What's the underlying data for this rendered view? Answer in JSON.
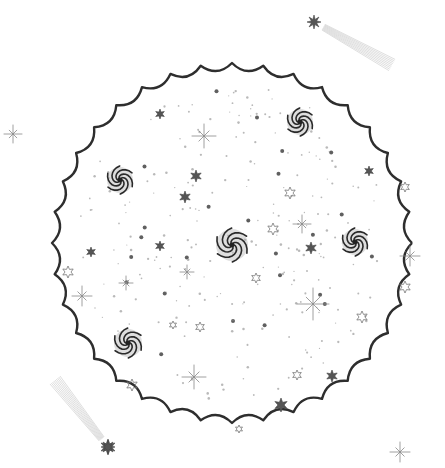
{
  "illustration": {
    "subject": "pencil drawing of a scalloped circular space scene with spiral galaxies, stars and shooting stars",
    "background": "#ffffff",
    "stroke_color": "#2e2e2e",
    "scallop_circle": {
      "cx": 232,
      "cy": 243,
      "r": 180,
      "bumps": 36
    },
    "galaxies": [
      {
        "x": 120,
        "y": 180,
        "r": 13
      },
      {
        "x": 300,
        "y": 122,
        "r": 13
      },
      {
        "x": 232,
        "y": 245,
        "r": 16
      },
      {
        "x": 355,
        "y": 242,
        "r": 13
      },
      {
        "x": 128,
        "y": 343,
        "r": 14
      }
    ],
    "filled_stars": [
      {
        "x": 196,
        "y": 176,
        "s": 6
      },
      {
        "x": 185,
        "y": 197,
        "s": 6
      },
      {
        "x": 91,
        "y": 252,
        "s": 5
      },
      {
        "x": 160,
        "y": 246,
        "s": 5
      },
      {
        "x": 311,
        "y": 248,
        "s": 6
      },
      {
        "x": 369,
        "y": 171,
        "s": 5
      },
      {
        "x": 160,
        "y": 114,
        "s": 5
      },
      {
        "x": 332,
        "y": 376,
        "s": 6
      },
      {
        "x": 281,
        "y": 405,
        "s": 7
      },
      {
        "x": 108,
        "y": 447,
        "s": 8
      }
    ],
    "outline_stars": [
      {
        "x": 290,
        "y": 193,
        "s": 6
      },
      {
        "x": 273,
        "y": 229,
        "s": 6
      },
      {
        "x": 68,
        "y": 272,
        "s": 6
      },
      {
        "x": 256,
        "y": 278,
        "s": 5
      },
      {
        "x": 200,
        "y": 327,
        "s": 5
      },
      {
        "x": 173,
        "y": 325,
        "s": 4
      },
      {
        "x": 132,
        "y": 385,
        "s": 6
      },
      {
        "x": 297,
        "y": 375,
        "s": 5
      },
      {
        "x": 362,
        "y": 317,
        "s": 6
      },
      {
        "x": 405,
        "y": 287,
        "s": 6
      },
      {
        "x": 405,
        "y": 187,
        "s": 5
      },
      {
        "x": 239,
        "y": 429,
        "s": 4
      }
    ],
    "sparkles": [
      {
        "x": 204,
        "y": 136,
        "s": 12
      },
      {
        "x": 302,
        "y": 224,
        "s": 9
      },
      {
        "x": 82,
        "y": 296,
        "s": 10
      },
      {
        "x": 126,
        "y": 283,
        "s": 7
      },
      {
        "x": 187,
        "y": 272,
        "s": 7
      },
      {
        "x": 313,
        "y": 304,
        "s": 16
      },
      {
        "x": 410,
        "y": 256,
        "s": 10
      },
      {
        "x": 194,
        "y": 377,
        "s": 12
      },
      {
        "x": 13,
        "y": 134,
        "s": 9
      },
      {
        "x": 400,
        "y": 452,
        "s": 10
      }
    ],
    "shooting_stars": [
      {
        "head_x": 314,
        "head_y": 22,
        "tail_x": 392,
        "tail_y": 65
      },
      {
        "head_x": 108,
        "head_y": 447,
        "tail_x": 55,
        "tail_y": 380
      }
    ]
  }
}
